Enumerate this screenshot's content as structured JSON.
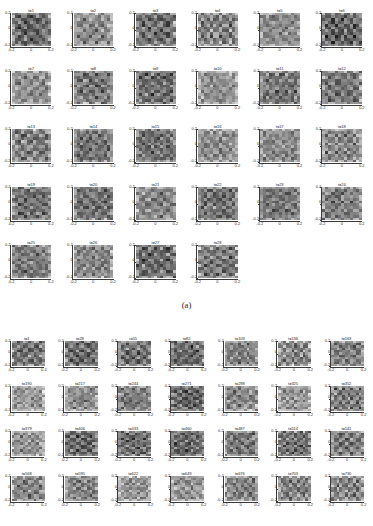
{
  "figure": {
    "caption_a": "(a)",
    "colormap": "grayscale",
    "axis": {
      "xticks": [
        "-0.2",
        "0",
        "0.2"
      ],
      "yticks": [
        "0.2",
        "0",
        "-0.2"
      ],
      "xlim": [
        -0.2,
        0.2
      ],
      "ylim": [
        -0.2,
        0.2
      ]
    }
  },
  "chart_data": [
    {
      "type": "heatmap",
      "panel": "a",
      "title": "(a)",
      "xlabel": "",
      "ylabel": "",
      "xlim": [
        -0.2,
        0.2
      ],
      "ylim": [
        -0.2,
        0.2
      ],
      "xticklabels": [
        "-0.2",
        "0",
        "0.2"
      ],
      "yticklabels": [
        "0.2",
        "0",
        "-0.2"
      ],
      "grid": false,
      "legend": "none",
      "colormap": "gray",
      "columns": 6,
      "rows": 5,
      "subplot_count": 28,
      "time_step": 1,
      "subplot_titles": [
        "t=1",
        "t=2",
        "t=3",
        "t=4",
        "t=5",
        "t=6",
        "t=7",
        "t=8",
        "t=9",
        "t=10",
        "t=11",
        "t=12",
        "t=13",
        "t=14",
        "t=15",
        "t=16",
        "t=17",
        "t=18",
        "t=19",
        "t=20",
        "t=21",
        "t=22",
        "t=23",
        "t=24",
        "t=25",
        "t=26",
        "t=27",
        "t=28"
      ]
    },
    {
      "type": "heatmap",
      "panel": "b",
      "title": "",
      "xlabel": "",
      "ylabel": "",
      "xlim": [
        -0.2,
        0.2
      ],
      "ylim": [
        -0.2,
        0.2
      ],
      "xticklabels": [
        "-0.2",
        "0",
        "0.2"
      ],
      "yticklabels": [
        "0.2",
        "0",
        "-0.2"
      ],
      "grid": false,
      "legend": "none",
      "colormap": "gray",
      "columns": 7,
      "rows": 4,
      "subplot_count": 28,
      "time_step": 27,
      "subplot_titles": [
        "t=1",
        "t=28",
        "t=55",
        "t=82",
        "t=109",
        "t=136",
        "t=163",
        "t=190",
        "t=217",
        "t=244",
        "t=271",
        "t=298",
        "t=325",
        "t=352",
        "t=379",
        "t=406",
        "t=433",
        "t=460",
        "t=487",
        "t=514",
        "t=541",
        "t=568",
        "t=595",
        "t=622",
        "t=649",
        "t=676",
        "t=703",
        "t=730"
      ]
    }
  ]
}
